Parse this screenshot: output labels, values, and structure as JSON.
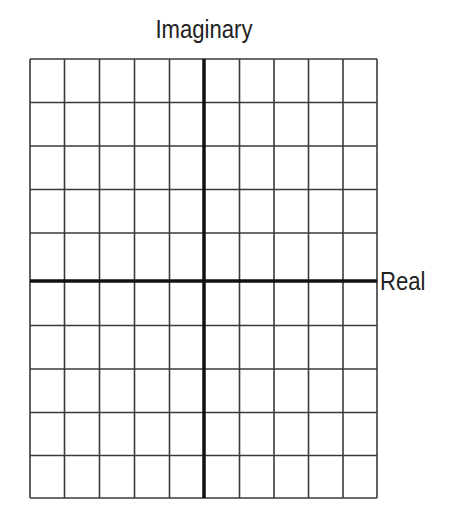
{
  "diagram": {
    "type": "complex-plane-grid",
    "vertical_axis_label": "Imaginary",
    "horizontal_axis_label": "Real",
    "grid": {
      "columns": 10,
      "rows": 10,
      "vertical_lines_x": [
        30,
        64.5,
        99.5,
        134.5,
        169.5,
        204,
        239.5,
        274,
        308.5,
        343,
        377
      ],
      "horizontal_lines_y": [
        59,
        102.5,
        146,
        189.5,
        233,
        281,
        325.5,
        369,
        412.5,
        455.5,
        498
      ],
      "imaginary_axis_index": 5,
      "real_axis_index": 5
    },
    "colors": {
      "grid_line": "#3a3a3a",
      "axis_line": "#111111",
      "label": "#222222",
      "background": "#ffffff"
    }
  }
}
